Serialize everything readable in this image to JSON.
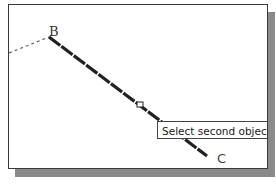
{
  "canvas": {
    "points": [
      {
        "label": "B"
      },
      {
        "label": "C"
      }
    ]
  },
  "tooltip": {
    "text": "Select second object or"
  },
  "colors": {
    "line": "#222222",
    "dashed": "#666666",
    "border": "#3a3a3a",
    "shadow": "#8a8a8a"
  }
}
